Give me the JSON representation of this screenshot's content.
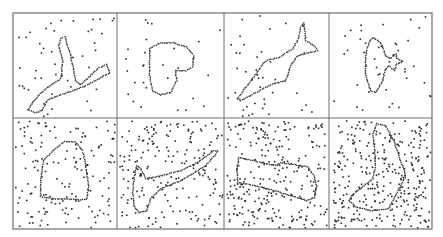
{
  "figure": {
    "background": "#ffffff",
    "border_color": "#6e6e6e",
    "dot_color": "#2a2a2a",
    "contour_color": "#3a3a3a",
    "grid": {
      "x_edges": [
        13,
        117,
        224,
        329,
        432
      ],
      "y_edges": [
        13,
        118,
        229
      ]
    },
    "panels": [
      {
        "name": "panel-branch-shape",
        "row": 0,
        "col": 0,
        "noise_count": 45,
        "seed": 11,
        "contour": [
          [
            60,
            38
          ],
          [
            64,
            36
          ],
          [
            70,
            55
          ],
          [
            75,
            80
          ],
          [
            80,
            84
          ],
          [
            97,
            68
          ],
          [
            106,
            64
          ],
          [
            109,
            72
          ],
          [
            100,
            77
          ],
          [
            85,
            85
          ],
          [
            72,
            90
          ],
          [
            55,
            96
          ],
          [
            47,
            99
          ],
          [
            41,
            110
          ],
          [
            34,
            112
          ],
          [
            27,
            109
          ],
          [
            35,
            98
          ],
          [
            45,
            88
          ],
          [
            60,
            78
          ],
          [
            62,
            60
          ],
          [
            58,
            45
          ],
          [
            60,
            38
          ]
        ]
      },
      {
        "name": "panel-heart-shape",
        "row": 0,
        "col": 1,
        "noise_count": 28,
        "seed": 23,
        "contour": [
          [
            149,
            48
          ],
          [
            160,
            42
          ],
          [
            172,
            42
          ],
          [
            186,
            46
          ],
          [
            193,
            55
          ],
          [
            192,
            66
          ],
          [
            185,
            70
          ],
          [
            175,
            70
          ],
          [
            176,
            80
          ],
          [
            170,
            92
          ],
          [
            160,
            94
          ],
          [
            152,
            90
          ],
          [
            149,
            75
          ],
          [
            149,
            60
          ],
          [
            149,
            48
          ]
        ]
      },
      {
        "name": "panel-fish-shape",
        "row": 0,
        "col": 2,
        "noise_count": 40,
        "seed": 37,
        "contour": [
          [
            237,
            98
          ],
          [
            250,
            80
          ],
          [
            265,
            60
          ],
          [
            278,
            57
          ],
          [
            292,
            48
          ],
          [
            297,
            40
          ],
          [
            300,
            27
          ],
          [
            303,
            22
          ],
          [
            305,
            40
          ],
          [
            315,
            46
          ],
          [
            317,
            50
          ],
          [
            297,
            55
          ],
          [
            290,
            65
          ],
          [
            285,
            80
          ],
          [
            270,
            84
          ],
          [
            255,
            92
          ],
          [
            240,
            100
          ],
          [
            236,
            97
          ]
        ]
      },
      {
        "name": "panel-racket-star-shape",
        "row": 0,
        "col": 3,
        "noise_count": 42,
        "seed": 51,
        "contour": [
          [
            372,
            37
          ],
          [
            380,
            42
          ],
          [
            385,
            55
          ],
          [
            389,
            58
          ],
          [
            395,
            53
          ],
          [
            396,
            58
          ],
          [
            402,
            61
          ],
          [
            396,
            63
          ],
          [
            394,
            70
          ],
          [
            388,
            65
          ],
          [
            384,
            70
          ],
          [
            382,
            80
          ],
          [
            375,
            92
          ],
          [
            370,
            90
          ],
          [
            365,
            75
          ],
          [
            365,
            55
          ],
          [
            368,
            42
          ],
          [
            372,
            37
          ]
        ]
      },
      {
        "name": "panel-pentagon-shape",
        "row": 1,
        "col": 0,
        "noise_count": 150,
        "seed": 67,
        "contour": [
          [
            64,
            141
          ],
          [
            74,
            141
          ],
          [
            82,
            150
          ],
          [
            85,
            165
          ],
          [
            88,
            185
          ],
          [
            86,
            199
          ],
          [
            78,
            199
          ],
          [
            55,
            198
          ],
          [
            40,
            196
          ],
          [
            40,
            180
          ],
          [
            43,
            160
          ],
          [
            52,
            150
          ],
          [
            64,
            141
          ]
        ]
      },
      {
        "name": "panel-mallet-shape",
        "row": 1,
        "col": 1,
        "noise_count": 200,
        "seed": 79,
        "contour": [
          [
            134,
            175
          ],
          [
            136,
            165
          ],
          [
            140,
            168
          ],
          [
            145,
            178
          ],
          [
            160,
            175
          ],
          [
            180,
            170
          ],
          [
            200,
            160
          ],
          [
            213,
            150
          ],
          [
            217,
            150
          ],
          [
            214,
            155
          ],
          [
            205,
            165
          ],
          [
            180,
            180
          ],
          [
            160,
            188
          ],
          [
            150,
            198
          ],
          [
            146,
            210
          ],
          [
            138,
            212
          ],
          [
            133,
            205
          ],
          [
            132,
            190
          ],
          [
            134,
            175
          ]
        ]
      },
      {
        "name": "panel-rectangle-shape",
        "row": 1,
        "col": 2,
        "noise_count": 260,
        "seed": 91,
        "contour": [
          [
            238,
            157
          ],
          [
            276,
            165
          ],
          [
            280,
            162
          ],
          [
            307,
            166
          ],
          [
            313,
            175
          ],
          [
            316,
            185
          ],
          [
            314,
            197
          ],
          [
            306,
            200
          ],
          [
            300,
            198
          ],
          [
            274,
            190
          ],
          [
            250,
            184
          ],
          [
            237,
            182
          ],
          [
            236,
            170
          ],
          [
            238,
            157
          ]
        ]
      },
      {
        "name": "panel-boot-shape",
        "row": 1,
        "col": 3,
        "noise_count": 320,
        "seed": 103,
        "contour": [
          [
            376,
            123
          ],
          [
            385,
            125
          ],
          [
            393,
            140
          ],
          [
            400,
            160
          ],
          [
            405,
            175
          ],
          [
            400,
            185
          ],
          [
            393,
            198
          ],
          [
            388,
            208
          ],
          [
            370,
            210
          ],
          [
            355,
            206
          ],
          [
            348,
            200
          ],
          [
            352,
            194
          ],
          [
            362,
            186
          ],
          [
            372,
            178
          ],
          [
            375,
            165
          ],
          [
            374,
            150
          ],
          [
            372,
            135
          ],
          [
            376,
            123
          ]
        ]
      }
    ]
  }
}
